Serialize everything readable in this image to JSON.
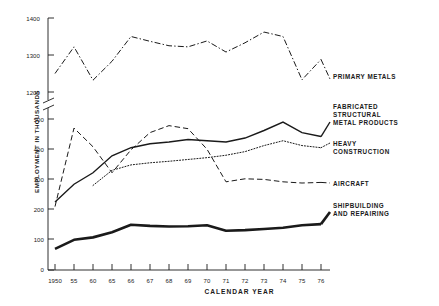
{
  "chart_data": {
    "type": "line",
    "title": "",
    "xlabel": "CALENDAR YEAR",
    "ylabel": "EMPLOYMENT IN THOUSANDS",
    "grid": false,
    "legend_position": "right-inline-annotations",
    "axis_break": {
      "present": true,
      "between": [
        500,
        1200
      ]
    },
    "yticks_upper": [
      "1200",
      "1300",
      "1400"
    ],
    "yticks_lower": [
      "0",
      "100",
      "200",
      "300",
      "400",
      "500"
    ],
    "ylim_upper": [
      1200,
      1400
    ],
    "ylim_lower": [
      0,
      500
    ],
    "categories": [
      "1950",
      "55",
      "60",
      "65",
      "66",
      "67",
      "68",
      "69",
      "70",
      "71",
      "72",
      "73",
      "74",
      "75",
      "76"
    ],
    "x": [
      1950,
      1955,
      1960,
      1965,
      1966,
      1967,
      1968,
      1969,
      1970,
      1971,
      1972,
      1973,
      1974,
      1975,
      1976
    ],
    "series": [
      {
        "name": "PRIMARY METALS",
        "style": "dash-dot",
        "panel": "upper",
        "values": [
          1250,
          1322,
          1232,
          1283,
          1350,
          1337,
          1325,
          1322,
          1338,
          1308,
          1333,
          1362,
          1350,
          1233,
          1288
        ]
      },
      {
        "name": "FABRICATED\nSTRUCTURAL\nMETAL PRODUCTS",
        "style": "solid-thin",
        "panel": "lower",
        "values": [
          225,
          284,
          322,
          378,
          405,
          418,
          424,
          432,
          428,
          424,
          437,
          462,
          490,
          455,
          442
        ]
      },
      {
        "name": "HEAVY\nCONSTRUCTION",
        "style": "dotted",
        "panel": "lower",
        "values": [
          null,
          null,
          280,
          330,
          348,
          355,
          360,
          366,
          372,
          380,
          392,
          412,
          428,
          412,
          405
        ]
      },
      {
        "name": "AIRCRAFT",
        "style": "dashed",
        "panel": "lower",
        "values": [
          210,
          470,
          408,
          322,
          398,
          455,
          478,
          468,
          400,
          292,
          302,
          300,
          292,
          288,
          290
        ]
      },
      {
        "name": "SHIPBUILDING\nAND REPAIRING",
        "style": "solid-thick",
        "panel": "lower",
        "values": [
          70,
          100,
          108,
          125,
          150,
          146,
          144,
          145,
          148,
          130,
          132,
          136,
          140,
          148,
          152
        ]
      }
    ]
  },
  "annotations": {
    "primary_metals": "PRIMARY METALS",
    "fabricated": "FABRICATED\nSTRUCTURAL\nMETAL PRODUCTS",
    "heavy_construction": "HEAVY\nCONSTRUCTION",
    "aircraft": "AIRCRAFT",
    "shipbuilding": "SHIPBUILDING\nAND REPAIRING"
  },
  "axis": {
    "y_title": "EMPLOYMENT IN THOUSANDS",
    "x_title": "CALENDAR YEAR",
    "y_ticks": [
      "1400",
      "1300",
      "1200",
      "500",
      "400",
      "300",
      "200",
      "100",
      "0"
    ],
    "x_ticks": [
      "1950",
      "55",
      "60",
      "65",
      "66",
      "67",
      "68",
      "69",
      "70",
      "71",
      "72",
      "73",
      "74",
      "75",
      "76"
    ]
  },
  "colors": {
    "ink": "#1a1a1a",
    "background": "#ffffff"
  }
}
